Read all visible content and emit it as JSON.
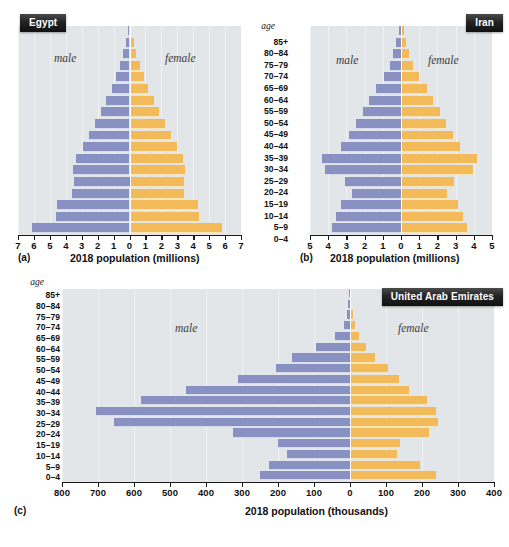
{
  "figure": {
    "age_header": "age",
    "age_groups": [
      "85+",
      "80–84",
      "75–79",
      "70–74",
      "65–69",
      "60–64",
      "55–59",
      "50–54",
      "45–49",
      "40–44",
      "35–39",
      "30–34",
      "25–29",
      "20–24",
      "15–19",
      "10–14",
      "5–9",
      "0–4"
    ],
    "male_label": "male",
    "female_label": "female",
    "colors": {
      "male_bar": "#8891c2",
      "female_bar": "#f2ba59",
      "plot_background": "#e3e6e8",
      "badge_background": "#232323",
      "badge_text": "#ffffff",
      "gridline": "#f2f4f5",
      "axis": "#1a1a1a"
    }
  },
  "panels": [
    {
      "key": "a",
      "fignum": "(a)",
      "badge": "Egypt",
      "chart_data": {
        "type": "bar",
        "title": "Egypt",
        "subtitle": "",
        "xlabel": "2018 population (millions)",
        "ylabel": "age",
        "categories": [
          "85+",
          "80–84",
          "75–79",
          "70–74",
          "65–69",
          "60–64",
          "55–59",
          "50–54",
          "45–49",
          "40–44",
          "35–39",
          "30–34",
          "25–29",
          "20–24",
          "15–19",
          "10–14",
          "5–9",
          "0–4"
        ],
        "series": [
          {
            "name": "male",
            "values": [
              0.1,
              0.24,
              0.38,
              0.6,
              0.86,
              1.12,
              1.45,
              1.8,
              2.18,
              2.55,
              2.95,
              3.35,
              3.55,
              3.5,
              3.6,
              4.55,
              4.6,
              6.15
            ]
          },
          {
            "name": "female",
            "values": [
              0.11,
              0.26,
              0.42,
              0.64,
              0.9,
              1.18,
              1.52,
              1.88,
              2.25,
              2.62,
              3.0,
              3.35,
              3.5,
              3.4,
              3.45,
              4.3,
              4.35,
              5.8
            ]
          }
        ],
        "xlim": [
          -7,
          7
        ],
        "xticks": [
          -7,
          -6,
          -5,
          -4,
          -3,
          -2,
          -1,
          0,
          1,
          2,
          3,
          4,
          5,
          6,
          7
        ],
        "xticklabels": [
          "7",
          "6",
          "5",
          "4",
          "3",
          "2",
          "1",
          "0",
          "1",
          "2",
          "3",
          "4",
          "5",
          "6",
          "7"
        ],
        "grid": true,
        "legend_position": "inside",
        "annotations": [
          "male",
          "female"
        ]
      }
    },
    {
      "key": "b",
      "fignum": "(b)",
      "badge": "Iran",
      "chart_data": {
        "type": "bar",
        "title": "Iran",
        "subtitle": "",
        "xlabel": "2018 population (millions)",
        "ylabel": "age",
        "categories": [
          "85+",
          "80–84",
          "75–79",
          "70–74",
          "65–69",
          "60–64",
          "55–59",
          "50–54",
          "45–49",
          "40–44",
          "35–39",
          "30–34",
          "25–29",
          "20–24",
          "15–19",
          "10–14",
          "5–9",
          "0–4"
        ],
        "series": [
          {
            "name": "male",
            "values": [
              0.12,
              0.28,
              0.42,
              0.62,
              0.95,
              1.4,
              1.75,
              2.1,
              2.45,
              2.85,
              3.3,
              4.35,
              4.15,
              3.05,
              2.7,
              3.3,
              3.55,
              3.8
            ]
          },
          {
            "name": "female",
            "values": [
              0.14,
              0.3,
              0.45,
              0.65,
              0.98,
              1.42,
              1.78,
              2.12,
              2.45,
              2.85,
              3.25,
              4.2,
              3.95,
              2.9,
              2.55,
              3.15,
              3.4,
              3.6
            ]
          }
        ],
        "xlim": [
          -5,
          5
        ],
        "xticks": [
          -5,
          -4,
          -3,
          -2,
          -1,
          0,
          1,
          2,
          3,
          4,
          5
        ],
        "xticklabels": [
          "5",
          "4",
          "3",
          "2",
          "1",
          "0",
          "1",
          "2",
          "3",
          "4",
          "5"
        ],
        "grid": true,
        "legend_position": "inside",
        "annotations": [
          "male",
          "female"
        ]
      }
    },
    {
      "key": "c",
      "fignum": "(c)",
      "badge": "United Arab Emirates",
      "chart_data": {
        "type": "bar",
        "title": "United Arab Emirates",
        "subtitle": "",
        "xlabel": "2018 population (thousands)",
        "ylabel": "age",
        "categories": [
          "85+",
          "80–84",
          "75–79",
          "70–74",
          "65–69",
          "60–64",
          "55–59",
          "50–54",
          "45–49",
          "40–44",
          "35–39",
          "30–34",
          "25–29",
          "20–24",
          "15–19",
          "10–14",
          "5–9",
          "0–4"
        ],
        "series": [
          {
            "name": "male",
            "values": [
              2,
              5,
              9,
              18,
              42,
              95,
              160,
              205,
              310,
              455,
              580,
              705,
              655,
              325,
              200,
              175,
              225,
              250
            ]
          },
          {
            "name": "female",
            "values": [
              2,
              4,
              7,
              14,
              25,
              45,
              70,
              105,
              135,
              165,
              215,
              240,
              245,
              220,
              140,
              130,
              195,
              240
            ]
          }
        ],
        "xlim": [
          -800,
          400
        ],
        "xticks": [
          -800,
          -700,
          -600,
          -500,
          -400,
          -300,
          -200,
          -100,
          0,
          100,
          200,
          300,
          400
        ],
        "xticklabels": [
          "800",
          "700",
          "600",
          "500",
          "400",
          "300",
          "200",
          "100",
          "0",
          "100",
          "200",
          "300",
          "400"
        ],
        "grid": true,
        "legend_position": "inside",
        "annotations": [
          "male",
          "female"
        ]
      }
    }
  ]
}
